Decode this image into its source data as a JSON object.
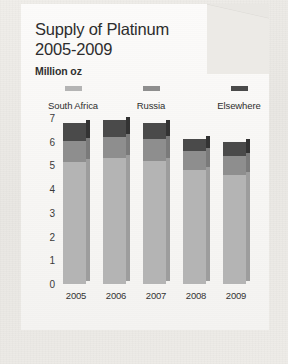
{
  "card": {
    "title_line_1": "Supply of Platinum",
    "title_line_2": "2005-2009",
    "subtitle": "Million oz"
  },
  "colors": {
    "south_africa": "#b4b4b4",
    "russia": "#8e8e8e",
    "elsewhere": "#4a4a4a",
    "south_africa_side": "#9d9d9d",
    "russia_side": "#7a7a7a",
    "elsewhere_side": "#333333",
    "text": "#2d2d2d",
    "card_bg": "#faf9f7",
    "page_bg": "#eceae6"
  },
  "chart_data": {
    "type": "bar",
    "title": "Supply of Platinum 2005-2009",
    "subtitle": "Million oz",
    "stacked": true,
    "xlabel": "",
    "ylabel": "Million oz",
    "ylim": [
      0,
      7
    ],
    "yticks": [
      "0",
      "1",
      "2",
      "3",
      "4",
      "5",
      "6",
      "7"
    ],
    "grid": false,
    "legend_position": "top",
    "categories": [
      "2005",
      "2006",
      "2007",
      "2008",
      "2009"
    ],
    "series": [
      {
        "name": "South Africa",
        "color": "#b4b4b4",
        "values": [
          5.15,
          5.3,
          5.2,
          4.8,
          4.6
        ]
      },
      {
        "name": "Russia",
        "color": "#8e8e8e",
        "values": [
          0.9,
          0.9,
          0.9,
          0.8,
          0.8
        ]
      },
      {
        "name": "Elsewhere",
        "color": "#4a4a4a",
        "values": [
          0.75,
          0.7,
          0.7,
          0.5,
          0.6
        ]
      }
    ],
    "totals": [
      6.8,
      6.9,
      6.8,
      6.1,
      6.0
    ]
  }
}
